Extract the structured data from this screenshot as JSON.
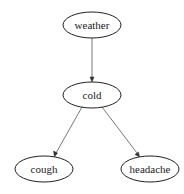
{
  "diagram": {
    "type": "directed-graph",
    "nodes": [
      {
        "id": "weather",
        "label": "weather",
        "cx": 92,
        "cy": 25,
        "rx": 29,
        "ry": 13
      },
      {
        "id": "cold",
        "label": "cold",
        "cx": 92,
        "cy": 95,
        "rx": 29,
        "ry": 13
      },
      {
        "id": "cough",
        "label": "cough",
        "cx": 44,
        "cy": 169,
        "rx": 29,
        "ry": 13
      },
      {
        "id": "headache",
        "label": "headache",
        "cx": 150,
        "cy": 169,
        "rx": 29,
        "ry": 13
      }
    ],
    "edges": [
      {
        "from": "weather",
        "to": "cold"
      },
      {
        "from": "cold",
        "to": "cough"
      },
      {
        "from": "cold",
        "to": "headache"
      }
    ],
    "colors": {
      "node_stroke": "#222222",
      "edge_stroke": "#555555",
      "background": "#ffffff"
    }
  }
}
